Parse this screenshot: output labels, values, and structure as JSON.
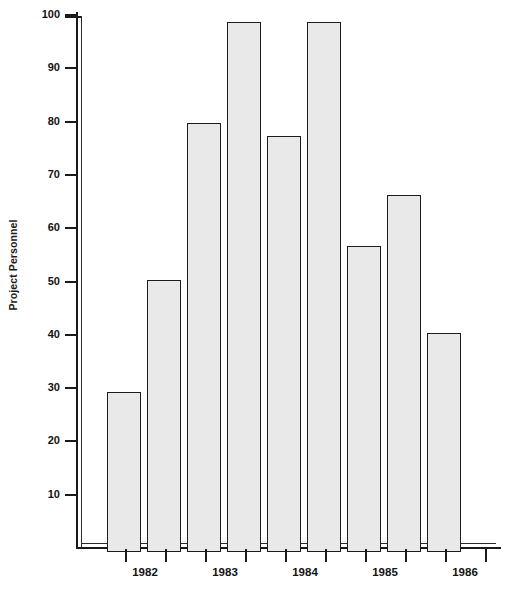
{
  "chart_data": {
    "type": "bar",
    "title": "",
    "xlabel": "",
    "ylabel": "Project Personnel",
    "ylim": [
      0,
      100
    ],
    "ytick_labels": [
      "100",
      "90",
      "80",
      "70",
      "60",
      "50",
      "40",
      "30",
      "20",
      "10"
    ],
    "ytick_values": [
      100,
      90,
      80,
      70,
      60,
      50,
      40,
      30,
      20,
      10
    ],
    "grid": false,
    "legend": "none",
    "xtick_group_labels": [
      "1982",
      "1983",
      "1984",
      "1985",
      "1986"
    ],
    "categories": [
      "1",
      "2",
      "3",
      "4",
      "5",
      "6",
      "7",
      "8",
      "9"
    ],
    "values": [
      30,
      51,
      80.5,
      99.5,
      78,
      99.5,
      57.5,
      67,
      41
    ]
  },
  "colors": {
    "bar_fill": "#e9e9e9",
    "bar_stroke": "#1c1c1c",
    "axis": "#1a1a1a",
    "text": "#121212",
    "background": "#ffffff"
  }
}
